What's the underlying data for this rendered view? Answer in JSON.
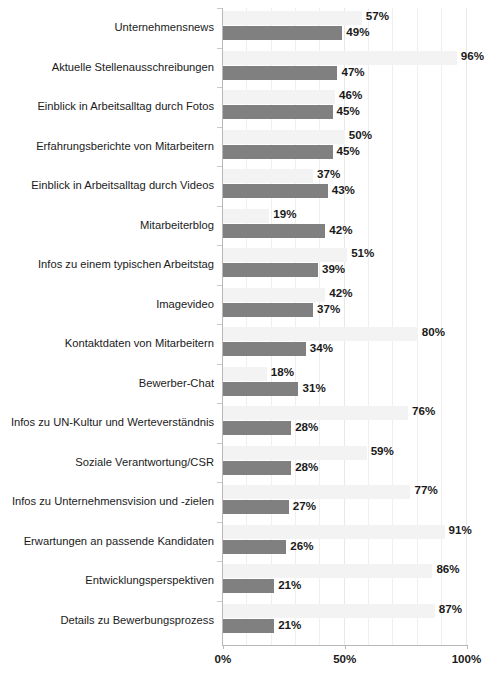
{
  "chart_data": {
    "type": "bar",
    "orientation": "horizontal",
    "title": "",
    "subtitle": "",
    "xlabel": "",
    "ylabel": "",
    "xlim": [
      0,
      100
    ],
    "xticks": [
      "0%",
      "50%",
      "100%"
    ],
    "xtick_values": [
      0,
      50,
      100
    ],
    "grid": true,
    "grid_interval": 10,
    "legend": "none",
    "value_suffix": "%",
    "categories": [
      "Unternehmensnews",
      "Aktuelle Stellenausschreibungen",
      "Einblick in Arbeitsalltag durch Fotos",
      "Erfahrungsberichte von Mitarbeitern",
      "Einblick in Arbeitsalltag durch Videos",
      "Mitarbeiterblog",
      "Infos zu einem typischen Arbeitstag",
      "Imagevideo",
      "Kontaktdaten von Mitarbeitern",
      "Bewerber-Chat",
      "Infos zu UN-Kultur und Werteverständnis",
      "Soziale Verantwortung/CSR",
      "Infos zu Unternehmensvision und -zielen",
      "Erwartungen an passende Kandidaten",
      "Entwicklungsperspektiven",
      "Details zu Bewerbungsprozess"
    ],
    "series": [
      {
        "name": "series-1",
        "color": "#f3f3f3",
        "values": [
          57,
          96,
          46,
          50,
          37,
          19,
          51,
          42,
          80,
          18,
          76,
          59,
          77,
          91,
          86,
          87
        ],
        "labels": [
          "57%",
          "96%",
          "46%",
          "50%",
          "37%",
          "19%",
          "51%",
          "42%",
          "80%",
          "18%",
          "76%",
          "59%",
          "77%",
          "91%",
          "86%",
          "87%"
        ]
      },
      {
        "name": "series-2",
        "color": "#808080",
        "values": [
          49,
          47,
          45,
          45,
          43,
          42,
          39,
          37,
          34,
          31,
          28,
          28,
          27,
          26,
          21,
          21
        ],
        "labels": [
          "49%",
          "47%",
          "45%",
          "45%",
          "43%",
          "42%",
          "39%",
          "37%",
          "34%",
          "31%",
          "28%",
          "28%",
          "27%",
          "26%",
          "21%",
          "21%"
        ]
      }
    ]
  }
}
